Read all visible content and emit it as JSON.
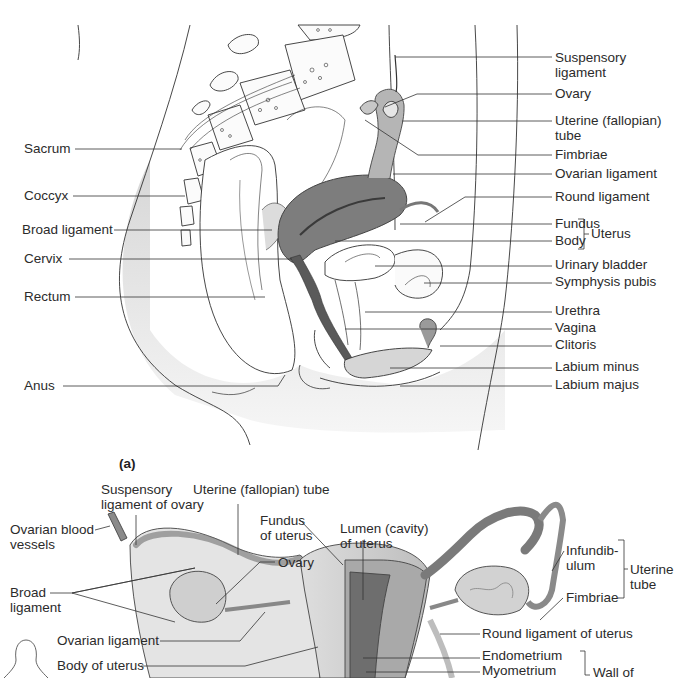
{
  "figure": {
    "panel_a_tag": "(a)",
    "panel_a": {
      "title": "Midsagittal section of female pelvis",
      "labels_left": [
        {
          "id": "sacrum",
          "text": "Sacrum",
          "x": 24,
          "y": 141,
          "line": [
            75,
            149,
            182,
            149
          ]
        },
        {
          "id": "coccyx",
          "text": "Coccyx",
          "x": 24,
          "y": 188,
          "line": [
            73,
            196,
            185,
            196
          ]
        },
        {
          "id": "broad-ligament",
          "text": "Broad ligament",
          "x": 22,
          "y": 222,
          "line": [
            114,
            230,
            272,
            230
          ]
        },
        {
          "id": "cervix",
          "text": "Cervix",
          "x": 24,
          "y": 251,
          "line": [
            69,
            259,
            292,
            259
          ]
        },
        {
          "id": "rectum",
          "text": "Rectum",
          "x": 24,
          "y": 289,
          "line": [
            75,
            297,
            265,
            297
          ]
        },
        {
          "id": "anus",
          "text": "Anus",
          "x": 24,
          "y": 378,
          "line": [
            63,
            386,
            278,
            386,
            285,
            375
          ]
        }
      ],
      "labels_right": [
        {
          "id": "suspensory-ligament",
          "text": "Suspensory\nligament",
          "x": 555,
          "y": 50,
          "line": [
            395,
            57,
            552,
            57
          ]
        },
        {
          "id": "ovary",
          "text": "Ovary",
          "x": 555,
          "y": 86,
          "line": [
            385,
            107,
            417,
            94,
            552,
            94
          ]
        },
        {
          "id": "uterine-tube",
          "text": "Uterine (fallopian)\ntube",
          "x": 555,
          "y": 113,
          "line": [
            402,
            121,
            552,
            121
          ]
        },
        {
          "id": "fimbriae",
          "text": "Fimbriae",
          "x": 555,
          "y": 147,
          "line": [
            365,
            120,
            418,
            155,
            552,
            155
          ]
        },
        {
          "id": "ovarian-ligament",
          "text": "Ovarian ligament",
          "x": 555,
          "y": 166,
          "line": [
            393,
            174,
            552,
            174
          ]
        },
        {
          "id": "round-ligament",
          "text": "Round ligament",
          "x": 555,
          "y": 189,
          "line": [
            425,
            222,
            465,
            197,
            552,
            197
          ]
        },
        {
          "id": "fundus",
          "text": "Fundus",
          "x": 555,
          "y": 216,
          "line": [
            400,
            224,
            552,
            224
          ]
        },
        {
          "id": "body",
          "text": "Body",
          "x": 555,
          "y": 233,
          "line": [
            335,
            241,
            552,
            241
          ]
        },
        {
          "id": "urinary-bladder",
          "text": "Urinary bladder",
          "x": 555,
          "y": 257,
          "line": [
            375,
            266,
            552,
            266
          ]
        },
        {
          "id": "symphysis-pubis",
          "text": "Symphysis pubis",
          "x": 555,
          "y": 274,
          "line": [
            424,
            283,
            552,
            283
          ]
        },
        {
          "id": "urethra",
          "text": "Urethra",
          "x": 555,
          "y": 303,
          "line": [
            365,
            312,
            552,
            312
          ]
        },
        {
          "id": "vagina",
          "text": "Vagina",
          "x": 555,
          "y": 320,
          "line": [
            345,
            329,
            552,
            329
          ]
        },
        {
          "id": "clitoris",
          "text": "Clitoris",
          "x": 555,
          "y": 337,
          "line": [
            440,
            346,
            552,
            346
          ]
        },
        {
          "id": "labium-minus",
          "text": "Labium minus",
          "x": 555,
          "y": 359,
          "line": [
            390,
            368,
            552,
            368
          ]
        },
        {
          "id": "labium-majus",
          "text": "Labium majus",
          "x": 555,
          "y": 377,
          "line": [
            400,
            386,
            552,
            386
          ]
        }
      ],
      "bracket": {
        "text": "Uterus",
        "x": 591,
        "y": 224
      }
    },
    "panel_b": {
      "title": "Posterior view of uterus, tubes and ovaries",
      "labels": [
        {
          "id": "suspensory-ligament-of-ovary",
          "text": "Suspensory\nligament of ovary",
          "x": 101,
          "y": 482,
          "line": [
            136,
            515,
            136,
            545
          ]
        },
        {
          "id": "uterine-tube-b",
          "text": "Uterine (fallopian) tube",
          "x": 193,
          "y": 482,
          "line": [
            238,
            504,
            238,
            555
          ]
        },
        {
          "id": "ovarian-blood-vessels",
          "text": "Ovarian blood\nvessels",
          "x": 10,
          "y": 522,
          "line": [
            95,
            530,
            110,
            526
          ]
        },
        {
          "id": "fundus-of-uterus",
          "text": "Fundus\nof uterus",
          "x": 260,
          "y": 513,
          "line": [
            300,
            520,
            343,
            565
          ]
        },
        {
          "id": "lumen-of-uterus",
          "text": "Lumen (cavity)\nof uterus",
          "x": 340,
          "y": 521,
          "line": [
            363,
            540,
            363,
            600
          ]
        },
        {
          "id": "ovary-b",
          "text": "Ovary",
          "x": 278,
          "y": 555,
          "line": [
            275,
            562,
            260,
            562,
            216,
            604
          ]
        },
        {
          "id": "broad-ligament-b",
          "text": "Broad\nligament",
          "x": 10,
          "y": 585,
          "line": [
            50,
            593,
            72,
            593,
            195,
            568,
            72,
            593,
            175,
            622
          ]
        },
        {
          "id": "ovarian-ligament-b",
          "text": "Ovarian ligament",
          "x": 57,
          "y": 633,
          "line": [
            160,
            641,
            240,
            641,
            265,
            612
          ]
        },
        {
          "id": "body-of-uterus",
          "text": "Body of uterus",
          "x": 57,
          "y": 658,
          "line": [
            141,
            666,
            245,
            666,
            318,
            647
          ]
        },
        {
          "id": "infundibulum",
          "text": "Infundib-\nulum",
          "x": 566,
          "y": 543,
          "line": [
            552,
            571,
            564,
            551
          ]
        },
        {
          "id": "fimbriae-b",
          "text": "Fimbriae",
          "x": 566,
          "y": 590,
          "line": [
            540,
            620,
            563,
            598
          ]
        },
        {
          "id": "round-ligament-of-uterus",
          "text": "Round ligament of uterus",
          "x": 482,
          "y": 626,
          "line": [
            440,
            634,
            480,
            634
          ]
        },
        {
          "id": "endometrium",
          "text": "Endometrium",
          "x": 482,
          "y": 650,
          "line": [
            363,
            658,
            480,
            658
          ]
        },
        {
          "id": "myometrium",
          "text": "Myometrium",
          "x": 482,
          "y": 664,
          "line": [
            366,
            672,
            480,
            672
          ]
        }
      ],
      "bracket_tube": {
        "text": "Uterine\ntube",
        "x": 628,
        "y": 570
      },
      "bracket_wall": {
        "text": "Wall of",
        "x": 596,
        "y": 665
      }
    }
  }
}
